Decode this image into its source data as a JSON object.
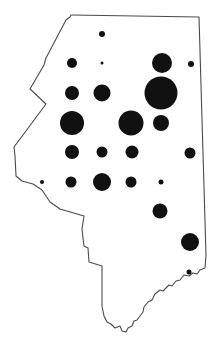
{
  "map": {
    "type": "proportional-symbol-map",
    "region": "state-outline",
    "colors": {
      "outline": "#4a4a4a",
      "symbol": "#111111",
      "background": "#ffffff"
    },
    "outline_path": "M72,15 L199,17 L206,255 L205,268 L200,270 L197,274 L193,273 L189,276 L184,275 L180,280 L176,281 L172,286 L169,285 L163,291 L160,290 L155,294 L152,300 L148,302 L144,307 L143,312 L140,316 L137,320 L134,321 L132,326 L128,328 L126,332 L122,331 L120,326 L115,328 L111,324 L107,322 L104,316 L102,306 L102,266 L89,262 L88,248 L84,246 L83,238 L82,229 L84,216 L60,209 L50,202 L42,190 L33,184 L22,181 L16,176 L15,156 L14,147 L23,135 L46,104 L30,89 L44,65 L46,58 L66,20 L70,17 L71,15 Z",
    "symbols": [
      {
        "x": 102,
        "y": 34,
        "r": 3
      },
      {
        "x": 72,
        "y": 63,
        "r": 5
      },
      {
        "x": 102,
        "y": 63,
        "r": 1.5
      },
      {
        "x": 162,
        "y": 63,
        "r": 10
      },
      {
        "x": 191,
        "y": 64,
        "r": 3
      },
      {
        "x": 72,
        "y": 93,
        "r": 7
      },
      {
        "x": 102,
        "y": 93,
        "r": 8.5
      },
      {
        "x": 161,
        "y": 93,
        "r": 16.5
      },
      {
        "x": 72,
        "y": 123,
        "r": 12
      },
      {
        "x": 131,
        "y": 123,
        "r": 12.5
      },
      {
        "x": 161,
        "y": 123,
        "r": 8
      },
      {
        "x": 72,
        "y": 152,
        "r": 7
      },
      {
        "x": 102,
        "y": 152,
        "r": 5.5
      },
      {
        "x": 132,
        "y": 152,
        "r": 6.5
      },
      {
        "x": 190,
        "y": 153,
        "r": 5.5
      },
      {
        "x": 42,
        "y": 182,
        "r": 2
      },
      {
        "x": 71,
        "y": 182,
        "r": 5.5
      },
      {
        "x": 102,
        "y": 182,
        "r": 9
      },
      {
        "x": 131,
        "y": 182,
        "r": 5.5
      },
      {
        "x": 161,
        "y": 182,
        "r": 2.5
      },
      {
        "x": 160,
        "y": 211,
        "r": 7.5
      },
      {
        "x": 190,
        "y": 242,
        "r": 9
      },
      {
        "x": 189,
        "y": 272,
        "r": 2.5
      }
    ]
  }
}
